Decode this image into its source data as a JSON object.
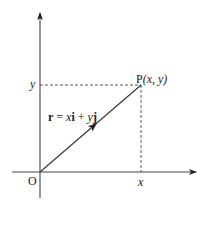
{
  "diagram": {
    "type": "position-vector",
    "origin_label": "O",
    "x_axis_label": "x",
    "y_axis_label": "y",
    "point": {
      "name": "P",
      "coords_label": "(x, y)"
    },
    "vector": {
      "label_r": "r",
      "label_eq": " = ",
      "label_x": "x",
      "label_i": "i",
      "label_plus": " + ",
      "label_y": "y",
      "label_j": "j"
    },
    "colors": {
      "line": "#333333",
      "background": "#ffffff"
    }
  }
}
